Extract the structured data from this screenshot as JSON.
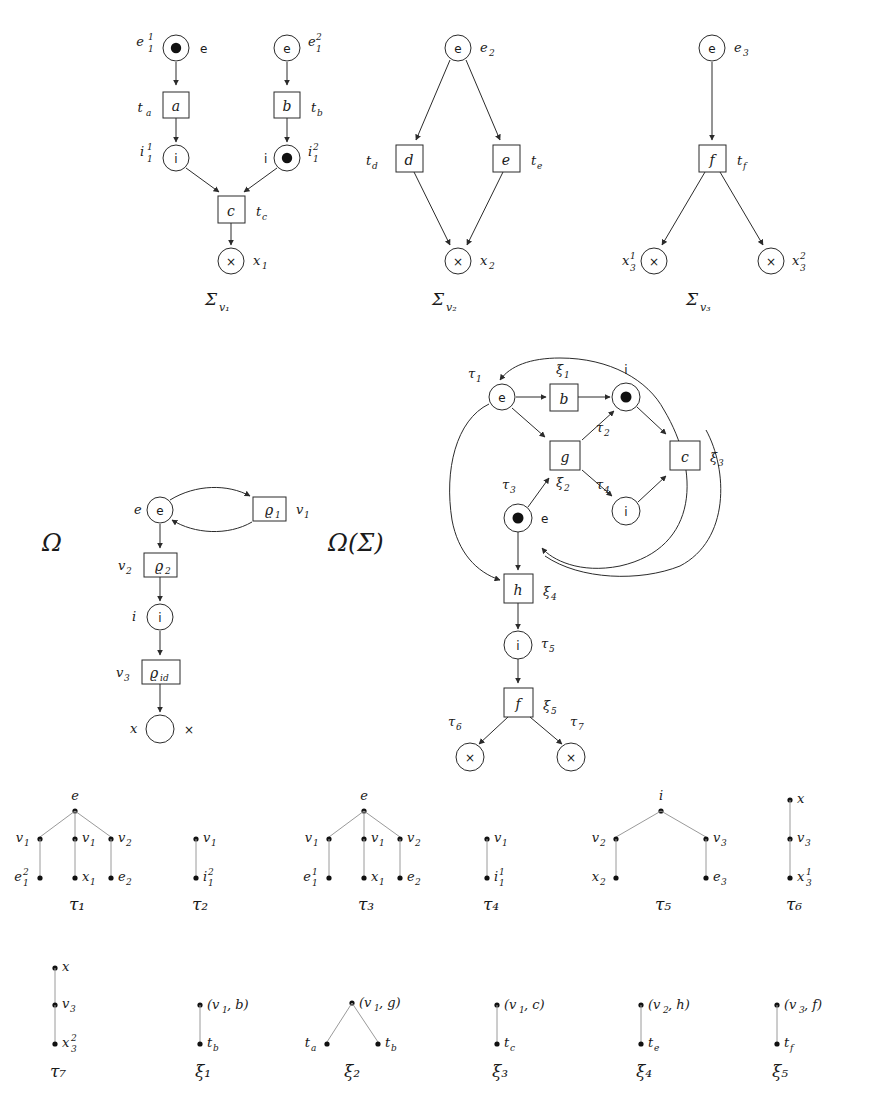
{
  "page": {
    "top_caption": "",
    "background": "#ffffff",
    "ink": "#1a1a1a"
  },
  "petri_nets": {
    "caption_prefix": "Σ",
    "nets": [
      {
        "caption": "Σ",
        "caption_sub": "v₁",
        "places": [
          {
            "name": "e1_1",
            "glyph": "e",
            "label_main": "e",
            "label_sup": "1",
            "label_sub": "1",
            "token": true,
            "label_side": "left",
            "glyph_side": "right"
          },
          {
            "name": "e1_2",
            "glyph": "e",
            "label_main": "e",
            "label_sup": "2",
            "label_sub": "1",
            "token": false,
            "label_side": "right",
            "glyph_side": "inside"
          },
          {
            "name": "i1_1",
            "glyph": "i",
            "label_main": "i",
            "label_sup": "1",
            "label_sub": "1",
            "token": false,
            "label_side": "left",
            "glyph_side": "inside"
          },
          {
            "name": "i1_2",
            "glyph": "i",
            "label_main": "i",
            "label_sup": "2",
            "label_sub": "1",
            "token": true,
            "label_side": "right",
            "glyph_side": "left"
          },
          {
            "name": "x1",
            "glyph": "×",
            "label_main": "x",
            "label_sup": "",
            "label_sub": "1",
            "token": false,
            "label_side": "right",
            "glyph_side": "inside"
          }
        ],
        "transitions": [
          {
            "name": "a",
            "glyph": "a",
            "label_main": "t",
            "label_sub": "a",
            "label_side": "left"
          },
          {
            "name": "b",
            "glyph": "b",
            "label_main": "t",
            "label_sub": "b",
            "label_side": "right"
          },
          {
            "name": "c",
            "glyph": "c",
            "label_main": "t",
            "label_sub": "c",
            "label_side": "right"
          }
        ],
        "arcs": [
          "e1_1->a",
          "a->i1_1",
          "e1_2->b",
          "b->i1_2",
          "i1_1->c",
          "i1_2->c",
          "c->x1"
        ]
      },
      {
        "caption": "Σ",
        "caption_sub": "v₂",
        "places": [
          {
            "name": "e2",
            "glyph": "e",
            "label_main": "e",
            "label_sup": "",
            "label_sub": "2",
            "token": false,
            "label_side": "right",
            "glyph_side": "inside"
          },
          {
            "name": "x2",
            "glyph": "×",
            "label_main": "x",
            "label_sup": "",
            "label_sub": "2",
            "token": false,
            "label_side": "right",
            "glyph_side": "inside"
          }
        ],
        "transitions": [
          {
            "name": "d",
            "glyph": "d",
            "label_main": "t",
            "label_sub": "d",
            "label_side": "left"
          },
          {
            "name": "e",
            "glyph": "e",
            "label_main": "t",
            "label_sub": "e",
            "label_side": "right"
          }
        ],
        "arcs": [
          "e2->d",
          "e2->e",
          "d->x2",
          "e->x2"
        ]
      },
      {
        "caption": "Σ",
        "caption_sub": "v₃",
        "places": [
          {
            "name": "e3",
            "glyph": "e",
            "label_main": "e",
            "label_sup": "",
            "label_sub": "3",
            "token": false,
            "label_side": "right",
            "glyph_side": "inside"
          },
          {
            "name": "x3_1",
            "glyph": "×",
            "label_main": "x",
            "label_sup": "1",
            "label_sub": "3",
            "token": false,
            "label_side": "left",
            "glyph_side": "inside"
          },
          {
            "name": "x3_2",
            "glyph": "×",
            "label_main": "x",
            "label_sup": "2",
            "label_sub": "3",
            "token": false,
            "label_side": "right",
            "glyph_side": "inside"
          }
        ],
        "transitions": [
          {
            "name": "f",
            "glyph": "f",
            "label_main": "t",
            "label_sub": "f",
            "label_side": "right"
          }
        ],
        "arcs": [
          "e3->f",
          "f->x3_1",
          "f->x3_2"
        ]
      }
    ]
  },
  "omega": {
    "title": "Ω",
    "places": [
      {
        "name": "e",
        "glyph": "e",
        "label": "e"
      },
      {
        "name": "i",
        "glyph": "i",
        "label": "i"
      },
      {
        "name": "x",
        "glyph": "×",
        "label": "x"
      }
    ],
    "transitions": [
      {
        "name": "rho1",
        "glyph_main": "ϱ",
        "glyph_sub": "1",
        "label_main": "v",
        "label_sub": "1",
        "label_side": "right"
      },
      {
        "name": "rho2",
        "glyph_main": "ϱ",
        "glyph_sub": "2",
        "label_main": "v",
        "label_sub": "2",
        "label_side": "left"
      },
      {
        "name": "rhoid",
        "glyph_main": "ϱ",
        "glyph_sub": "id",
        "label_main": "v",
        "label_sub": "3",
        "label_side": "left"
      }
    ],
    "arcs": [
      "e->rho1 (curved)",
      "rho1->e (curved)",
      "e->rho2",
      "rho2->i",
      "i->rhoid",
      "rhoid->x"
    ]
  },
  "omega_sigma": {
    "title": "Ω(Σ)",
    "places": [
      {
        "name": "place-e-top",
        "glyph": "e",
        "token": false,
        "label": "τ",
        "label_sub": "1",
        "label_pos": "upper-left"
      },
      {
        "name": "place-i-top",
        "glyph": "i",
        "token": true,
        "label": "i",
        "label_sub": "",
        "label_pos": "above",
        "tau": "τ",
        "tau_sub": "2"
      },
      {
        "name": "place-e-mid",
        "glyph": "e",
        "token": true,
        "label": "e",
        "label_sub": "",
        "label_pos": "right",
        "tau": "τ",
        "tau_sub": "3"
      },
      {
        "name": "place-i-low",
        "glyph": "i",
        "token": false,
        "label": "",
        "label_sub": "",
        "tau": "τ",
        "tau_sub": "4"
      },
      {
        "name": "place-i-chain",
        "glyph": "i",
        "token": false,
        "tau": "τ",
        "tau_sub": "5"
      },
      {
        "name": "place-x-left",
        "glyph": "×",
        "token": false,
        "tau": "τ",
        "tau_sub": "6"
      },
      {
        "name": "place-x-right",
        "glyph": "×",
        "token": false,
        "tau": "τ",
        "tau_sub": "7"
      }
    ],
    "transitions": [
      {
        "name": "b",
        "glyph": "b",
        "label": "ξ",
        "label_sub": "1"
      },
      {
        "name": "g",
        "glyph": "g",
        "label": "ξ",
        "label_sub": "2"
      },
      {
        "name": "c",
        "glyph": "c",
        "label": "ξ",
        "label_sub": "3"
      },
      {
        "name": "h",
        "glyph": "h",
        "label": "ξ",
        "label_sub": "4"
      },
      {
        "name": "f",
        "glyph": "f",
        "label": "ξ",
        "label_sub": "5"
      }
    ]
  },
  "trees": {
    "row1": [
      {
        "name": "τ",
        "name_sub": "1",
        "root": {
          "label": "e",
          "label_pos": "above"
        },
        "children": [
          {
            "label": "v",
            "sub": "1",
            "side": "left",
            "leaf": {
              "label": "e",
              "sup": "2",
              "sub": "1",
              "side": "left"
            }
          },
          {
            "label": "v",
            "sub": "1",
            "side": "right",
            "leaf": {
              "label": "x",
              "sub": "1",
              "side": "right"
            }
          },
          {
            "label": "v",
            "sub": "2",
            "side": "right",
            "leaf": {
              "label": "e",
              "sub": "2",
              "side": "right"
            }
          }
        ]
      },
      {
        "name": "τ",
        "name_sub": "2",
        "root": null,
        "chain": [
          {
            "label": "v",
            "sub": "1",
            "side": "right"
          },
          {
            "label": "i",
            "sup": "2",
            "sub": "1",
            "side": "right"
          }
        ]
      },
      {
        "name": "τ",
        "name_sub": "3",
        "root": {
          "label": "e",
          "label_pos": "above"
        },
        "children": [
          {
            "label": "v",
            "sub": "1",
            "side": "left",
            "leaf": {
              "label": "e",
              "sup": "1",
              "sub": "1",
              "side": "left"
            }
          },
          {
            "label": "v",
            "sub": "1",
            "side": "right",
            "leaf": {
              "label": "x",
              "sub": "1",
              "side": "right"
            }
          },
          {
            "label": "v",
            "sub": "2",
            "side": "right",
            "leaf": {
              "label": "e",
              "sub": "2",
              "side": "right"
            }
          }
        ]
      },
      {
        "name": "τ",
        "name_sub": "4",
        "root": null,
        "chain": [
          {
            "label": "v",
            "sub": "1",
            "side": "right"
          },
          {
            "label": "i",
            "sup": "1",
            "sub": "1",
            "side": "right"
          }
        ]
      },
      {
        "name": "τ",
        "name_sub": "5",
        "root": {
          "label": "i",
          "label_pos": "above"
        },
        "children": [
          {
            "label": "v",
            "sub": "2",
            "side": "left",
            "leaf": {
              "label": "x",
              "sub": "2",
              "side": "left"
            }
          },
          {
            "label": "v",
            "sub": "3",
            "side": "right",
            "leaf": {
              "label": "e",
              "sub": "3",
              "side": "right"
            }
          }
        ]
      },
      {
        "name": "τ",
        "name_sub": "6",
        "root": null,
        "chain": [
          {
            "label": "x",
            "side": "right"
          },
          {
            "label": "v",
            "sub": "3",
            "side": "right"
          },
          {
            "label": "x",
            "sup": "1",
            "sub": "3",
            "side": "right"
          }
        ]
      }
    ],
    "row2": [
      {
        "name": "τ",
        "name_sub": "7",
        "root": null,
        "chain": [
          {
            "label": "x",
            "side": "right"
          },
          {
            "label": "v",
            "sub": "3",
            "side": "right"
          },
          {
            "label": "x",
            "sup": "2",
            "sub": "3",
            "side": "right"
          }
        ]
      },
      {
        "name": "ξ",
        "name_sub": "1",
        "root": null,
        "chain": [
          {
            "label": "(v₁, b)",
            "side": "right"
          },
          {
            "label": "t",
            "sub": "b",
            "side": "right"
          }
        ]
      },
      {
        "name": "ξ",
        "name_sub": "2",
        "root": {
          "label": "(v₁, g)",
          "label_pos": "right"
        },
        "children": [
          {
            "label": "t",
            "sub": "a",
            "side": "left"
          },
          {
            "label": "t",
            "sub": "b",
            "side": "right"
          }
        ]
      },
      {
        "name": "ξ",
        "name_sub": "3",
        "root": null,
        "chain": [
          {
            "label": "(v₁, c)",
            "side": "right"
          },
          {
            "label": "t",
            "sub": "c",
            "side": "right"
          }
        ]
      },
      {
        "name": "ξ",
        "name_sub": "4",
        "root": null,
        "chain": [
          {
            "label": "(v₂, h)",
            "side": "right"
          },
          {
            "label": "t",
            "sub": "e",
            "side": "right"
          }
        ]
      },
      {
        "name": "ξ",
        "name_sub": "5",
        "root": null,
        "chain": [
          {
            "label": "(v₃, f)",
            "side": "right"
          },
          {
            "label": "t",
            "sub": "f",
            "side": "right"
          }
        ]
      }
    ]
  },
  "labels": {
    "sigma_v1": "Σ",
    "sigma_v1_sub": "v₁",
    "sigma_v2": "Σ",
    "sigma_v2_sub": "v₂",
    "sigma_v3": "Σ",
    "sigma_v3_sub": "v₃",
    "omega": "Ω",
    "omega_sigma": "Ω(Σ)",
    "tau1": "τ₁",
    "tau2": "τ₂",
    "tau3": "τ₃",
    "tau4": "τ₄",
    "tau5": "τ₅",
    "tau6": "τ₆",
    "tau7": "τ₇",
    "xi1": "ξ₁",
    "xi2": "ξ₂",
    "xi3": "ξ₃",
    "xi4": "ξ₄",
    "xi5": "ξ₅",
    "rho1": "ϱ₁",
    "rho2": "ϱ₂",
    "rhoid": "ϱid",
    "e": "e",
    "i": "i",
    "x": "×",
    "ta": "ta",
    "tb": "tb",
    "tc": "tc",
    "td": "td",
    "te": "te",
    "tf": "tf",
    "box_a": "a",
    "box_b": "b",
    "box_c": "c",
    "box_d": "d",
    "box_e": "e",
    "box_f": "f",
    "box_g": "g",
    "box_h": "h",
    "e1_1": "e₁¹",
    "e1_2": "e₁²",
    "i1_1": "i₁¹",
    "i1_2": "i₁²",
    "e2": "e₂",
    "e3": "e₃",
    "x1": "x₁",
    "x2": "x₂",
    "x3_1": "x₃¹",
    "x3_2": "x₃²",
    "v1": "v₁",
    "v2": "v₂",
    "v3": "v₃"
  }
}
